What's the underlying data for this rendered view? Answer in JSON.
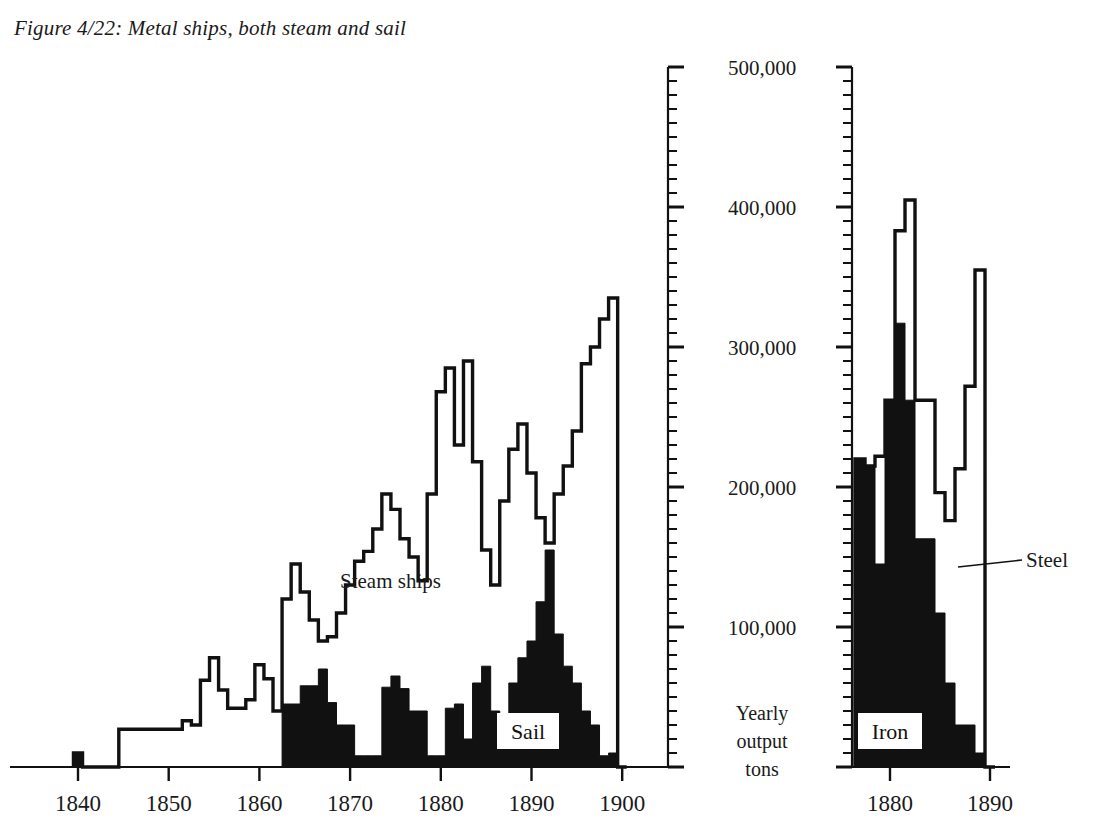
{
  "figure": {
    "title": "Figure 4/22: Metal ships, both steam and sail"
  },
  "axis": {
    "y_caption_line1": "Yearly",
    "y_caption_line2": "output",
    "y_caption_line3": "tons",
    "y_labels": [
      "500,000",
      "400,000",
      "300,000",
      "200,000",
      "100,000"
    ],
    "y_values": [
      500000,
      400000,
      300000,
      200000,
      100000
    ],
    "y_min": 0,
    "y_max": 500000,
    "minor_tick_step": 10000,
    "left_x_labels": [
      "1840",
      "1850",
      "1860",
      "1870",
      "1880",
      "1890",
      "1900"
    ],
    "right_x_labels": [
      "1880",
      "1890"
    ]
  },
  "labels": {
    "steam_ships": "Steam ships",
    "sail": "Sail",
    "iron": "Iron",
    "steel": "Steel"
  },
  "colors": {
    "ink": "#111111",
    "paper": "#ffffff"
  },
  "chart_data": [
    {
      "id": "left-chart",
      "type": "area",
      "title": "Metal ships, both steam and sail",
      "xlabel": "",
      "ylabel": "Yearly output tons",
      "xlim": [
        1839,
        1901
      ],
      "ylim": [
        0,
        500000
      ],
      "grid": false,
      "legend": "in-plot annotations",
      "x": [
        1840,
        1841,
        1842,
        1843,
        1844,
        1845,
        1846,
        1847,
        1848,
        1849,
        1850,
        1851,
        1852,
        1853,
        1854,
        1855,
        1856,
        1857,
        1858,
        1859,
        1860,
        1861,
        1862,
        1863,
        1864,
        1865,
        1866,
        1867,
        1868,
        1869,
        1870,
        1871,
        1872,
        1873,
        1874,
        1875,
        1876,
        1877,
        1878,
        1879,
        1880,
        1881,
        1882,
        1883,
        1884,
        1885,
        1886,
        1887,
        1888,
        1889,
        1890,
        1891,
        1892,
        1893,
        1894,
        1895,
        1896,
        1897,
        1898,
        1899,
        1900
      ],
      "series": [
        {
          "name": "Steam ships",
          "style": "outline",
          "values": [
            10000,
            0,
            0,
            0,
            0,
            27000,
            27000,
            27000,
            27000,
            27000,
            27000,
            27000,
            33000,
            30000,
            62000,
            78000,
            55000,
            42000,
            42000,
            48000,
            73000,
            63000,
            40000,
            120000,
            145000,
            125000,
            105000,
            90000,
            93000,
            110000,
            130000,
            147000,
            154000,
            170000,
            195000,
            184000,
            163000,
            150000,
            133000,
            195000,
            268000,
            285000,
            230000,
            290000,
            218000,
            155000,
            130000,
            190000,
            227000,
            245000,
            210000,
            178000,
            160000,
            195000,
            215000,
            240000,
            288000,
            300000,
            320000,
            335000,
            0
          ]
        },
        {
          "name": "Sail",
          "style": "filled",
          "values": [
            10000,
            0,
            0,
            0,
            0,
            0,
            0,
            0,
            0,
            0,
            0,
            0,
            0,
            0,
            0,
            0,
            0,
            0,
            0,
            0,
            0,
            0,
            0,
            45000,
            45000,
            58000,
            58000,
            70000,
            46000,
            30000,
            30000,
            8000,
            8000,
            8000,
            57000,
            65000,
            56000,
            40000,
            40000,
            8000,
            8000,
            42000,
            45000,
            20000,
            60000,
            72000,
            40000,
            30000,
            60000,
            78000,
            90000,
            118000,
            155000,
            95000,
            72000,
            60000,
            40000,
            30000,
            8000,
            10000,
            0
          ]
        }
      ]
    },
    {
      "id": "right-chart",
      "type": "area",
      "title": "Iron and steel output",
      "xlabel": "",
      "ylabel": "Yearly output tons",
      "xlim": [
        1876.5,
        1890.5
      ],
      "ylim": [
        0,
        500000
      ],
      "grid": false,
      "legend": "in-plot annotations",
      "x": [
        1877,
        1878,
        1879,
        1880,
        1881,
        1882,
        1883,
        1884,
        1885,
        1886,
        1887,
        1888,
        1889,
        1890
      ],
      "series": [
        {
          "name": "Steel",
          "style": "outline",
          "values": [
            220000,
            215000,
            222000,
            262000,
            383000,
            405000,
            262000,
            262000,
            196000,
            176000,
            213000,
            272000,
            355000,
            0
          ]
        },
        {
          "name": "Iron",
          "style": "filled",
          "values": [
            220000,
            215000,
            145000,
            262000,
            317000,
            262000,
            163000,
            163000,
            110000,
            60000,
            30000,
            30000,
            10000,
            0
          ]
        }
      ]
    }
  ]
}
